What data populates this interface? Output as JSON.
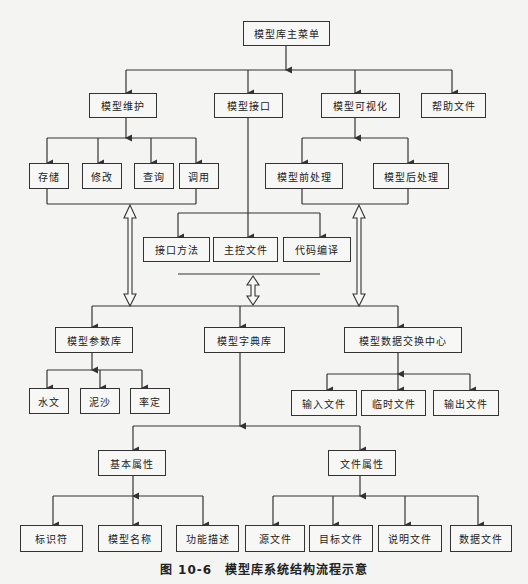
{
  "diagram": {
    "root": "模型库主菜单",
    "level1": [
      "模型维护",
      "模型接口",
      "模型可视化",
      "帮助文件"
    ],
    "maintenance": [
      "存储",
      "修改",
      "查询",
      "调用"
    ],
    "interface": [
      "接口方法",
      "主控文件",
      "代码编译"
    ],
    "visualization": [
      "模型前处理",
      "模型后处理"
    ],
    "level2": [
      "模型参数库",
      "模型字典库",
      "模型数据交换中心"
    ],
    "param_lib": [
      "水文",
      "泥沙",
      "率定"
    ],
    "exchange": [
      "输入文件",
      "临时文件",
      "输出文件"
    ],
    "dict_attrs": [
      "基本属性",
      "文件属性"
    ],
    "basic_attrs": [
      "标识符",
      "模型名称",
      "功能描述"
    ],
    "file_attrs": [
      "源文件",
      "目标文件",
      "说明文件",
      "数据文件"
    ]
  },
  "caption": "图 10-6　模型库系统结构流程示意"
}
